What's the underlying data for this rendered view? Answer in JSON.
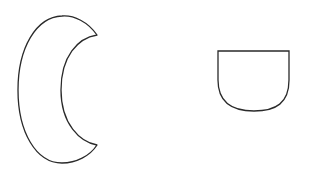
{
  "canvas": {
    "width": 309,
    "height": 172,
    "background": "#ffffff"
  },
  "stroke": {
    "color": "#2a2a2a",
    "width": 1.3
  },
  "shapes": [
    {
      "id": "crescent",
      "label": "crescent-shape",
      "fill": "#ffffff"
    },
    {
      "id": "cup",
      "label": "u-shape",
      "fill": "#ffffff"
    }
  ]
}
